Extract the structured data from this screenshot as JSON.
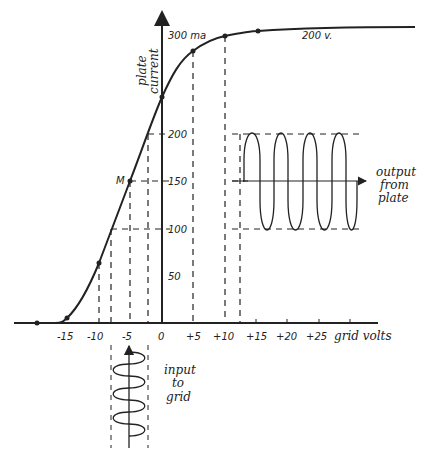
{
  "axes": {
    "y_label_line1": "plate",
    "y_label_line2": "current",
    "x_label": "grid volts",
    "y_ticks": [
      {
        "label": "300 ma",
        "value": 300
      },
      {
        "label": "200",
        "value": 200
      },
      {
        "label": "150",
        "value": 150
      },
      {
        "label": "100",
        "value": 100
      },
      {
        "label": "50",
        "value": 50
      }
    ],
    "x_ticks": [
      {
        "label": "-15",
        "value": -15
      },
      {
        "label": "-10",
        "value": -10
      },
      {
        "label": "-5",
        "value": -5
      },
      {
        "label": "0",
        "value": 0
      },
      {
        "label": "+5",
        "value": 5
      },
      {
        "label": "+10",
        "value": 10
      },
      {
        "label": "+15",
        "value": 15
      },
      {
        "label": "+20",
        "value": 20
      },
      {
        "label": "+25",
        "value": 25
      }
    ]
  },
  "annotations": {
    "curve_label": "200 v.",
    "operating_point": "M",
    "output_line1": "output",
    "output_line2": "from",
    "output_line3": "plate",
    "input_line1": "input",
    "input_line2": "to",
    "input_line3": "grid"
  },
  "curve_points": [
    {
      "grid_v": -20,
      "plate_ma": 0
    },
    {
      "grid_v": -15,
      "plate_ma": 5
    },
    {
      "grid_v": -10,
      "plate_ma": 63
    },
    {
      "grid_v": -5,
      "plate_ma": 150
    },
    {
      "grid_v": 0,
      "plate_ma": 238
    },
    {
      "grid_v": 5,
      "plate_ma": 286
    },
    {
      "grid_v": 10,
      "plate_ma": 302
    },
    {
      "grid_v": 15,
      "plate_ma": 307
    },
    {
      "grid_v": 40,
      "plate_ma": 310
    }
  ]
}
